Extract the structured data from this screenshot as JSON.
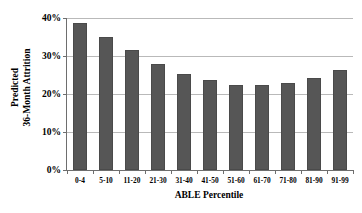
{
  "chart_data": {
    "type": "bar",
    "title": "",
    "xlabel": "ABLE Percentile",
    "ylabel_lines": [
      "Predicted",
      "36-Month Attrition"
    ],
    "ylabel": "Predicted 36-Month Attrition",
    "categories": [
      "0-4",
      "5-10",
      "11-20",
      "21-30",
      "31-40",
      "41-50",
      "51-60",
      "61-70",
      "71-80",
      "81-90",
      "91-99"
    ],
    "values": [
      38.7,
      35.0,
      31.5,
      28.0,
      25.3,
      23.8,
      22.5,
      22.3,
      22.9,
      24.1,
      26.3
    ],
    "value_labels": [
      "38.7%",
      "35.0%",
      "31.5%",
      "28.0%",
      "25.3%",
      "23.8%",
      "22.5%",
      "22.3%",
      "22.9%",
      "24.1%",
      "26.3%"
    ],
    "ylim": [
      0,
      40
    ],
    "ytick_values": [
      0,
      10,
      20,
      30,
      40
    ],
    "ytick_labels": [
      "0%",
      "10%",
      "20%",
      "30%",
      "40%"
    ],
    "grid": true,
    "legend": false,
    "legend_position": "none",
    "bar_color": "#565656",
    "bar_border_color": "#4a4a4a",
    "gridline_color": "#b9b9b9",
    "axis_color": "#6e6e6e",
    "background_color": "#ffffff"
  }
}
